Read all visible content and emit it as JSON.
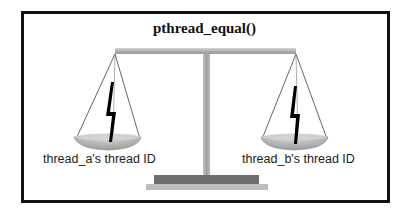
{
  "diagram": {
    "title": "pthread_equal()",
    "left_pan": {
      "label": "thread_a's thread ID",
      "icon": "lightning-bolt-icon"
    },
    "right_pan": {
      "label": "thread_b's thread ID",
      "icon": "lightning-bolt-icon"
    },
    "colors": {
      "frame": "#111111",
      "beam": "#b4b4b4",
      "post": "#a8a8a8",
      "base_top": "#6e6e6e",
      "base_bottom": "#bdbdbd",
      "pan": "#b0b0b0",
      "strings": "#555555",
      "bolt": "#000000"
    }
  }
}
